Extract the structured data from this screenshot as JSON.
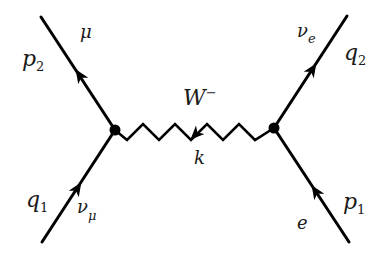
{
  "diagram": {
    "type": "feynman-diagram",
    "process": "muon neutrino - electron scattering via W- exchange",
    "vertices": [
      {
        "id": "left",
        "x": 115,
        "y": 130
      },
      {
        "id": "right",
        "x": 274,
        "y": 128
      }
    ],
    "external_lines": [
      {
        "id": "top-left",
        "particle": "μ",
        "momentum": "p",
        "momentum_sub": "2",
        "arrow": "outgoing"
      },
      {
        "id": "bottom-left",
        "particle": "ν",
        "particle_sub": "μ",
        "momentum": "q",
        "momentum_sub": "1",
        "arrow": "incoming"
      },
      {
        "id": "top-right",
        "particle": "ν",
        "particle_sub": "e",
        "momentum": "q",
        "momentum_sub": "2",
        "arrow": "outgoing"
      },
      {
        "id": "bottom-right",
        "particle": "e",
        "momentum": "p",
        "momentum_sub": "1",
        "arrow": "incoming"
      }
    ],
    "propagator": {
      "particle": "W",
      "charge": "−",
      "momentum": "k",
      "style": "zigzag",
      "arrow": "leftward"
    },
    "colors": {
      "line": "#000000",
      "text": "#1a1a1a",
      "background": "#ffffff"
    }
  }
}
